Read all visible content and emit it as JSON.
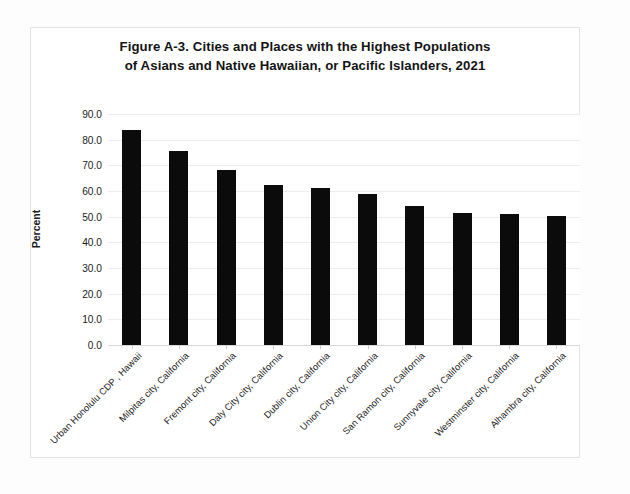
{
  "figure": {
    "title_line1": "Figure A-3. Cities and Places with the Highest Populations",
    "title_line2": "of Asians and Native Hawaiian, or Pacific Islanders, 2021"
  },
  "chart_data": {
    "type": "bar",
    "title": "Figure A-3. Cities and Places with the Highest Populations of Asians and Native Hawaiian, or Pacific Islanders, 2021",
    "xlabel": "",
    "ylabel": "Percent",
    "ylim": [
      0.0,
      90.0
    ],
    "ytick_step": 10.0,
    "ytick_labels": [
      "90.0",
      "80.0",
      "70.0",
      "60.0",
      "50.0",
      "40.0",
      "30.0",
      "20.0",
      "10.0",
      "0.0"
    ],
    "ytick_values": [
      90.0,
      80.0,
      70.0,
      60.0,
      50.0,
      40.0,
      30.0,
      20.0,
      10.0,
      0.0
    ],
    "grid": true,
    "legend": false,
    "bar_color": "#0b0b0b",
    "categories": [
      "Urban Honolulu CDP , Hawaii",
      "Milpitas city, California",
      "Fremont city, California",
      "Daly City city, California",
      "Dublin city, California",
      "Union City city, California",
      "San Ramon city, California",
      "Sunnyvale city, California",
      "Westminster city, California",
      "Alhambra city, California"
    ],
    "values": [
      83.8,
      75.5,
      68.3,
      62.5,
      61.3,
      58.8,
      54.3,
      51.3,
      51.2,
      50.2
    ]
  }
}
